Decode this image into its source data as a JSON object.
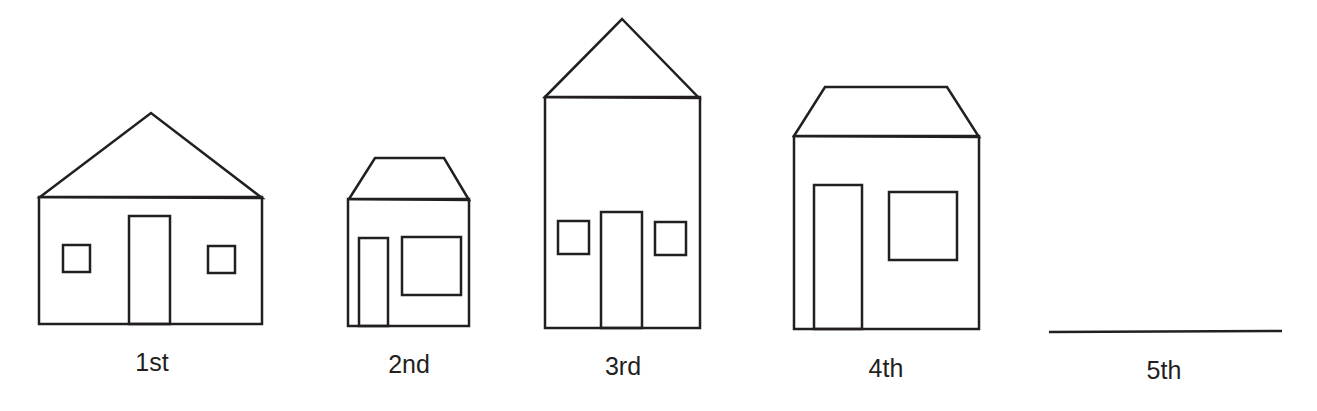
{
  "diagram": {
    "stroke_color": "#231f20",
    "houses": [
      {
        "label": "1st",
        "label_x": 152,
        "label_y": 348
      },
      {
        "label": "2nd",
        "label_x": 409,
        "label_y": 350
      },
      {
        "label": "3rd",
        "label_x": 623,
        "label_y": 352
      },
      {
        "label": "4th",
        "label_x": 886,
        "label_y": 354
      },
      {
        "label": "5th",
        "label_x": 1164,
        "label_y": 356
      }
    ]
  }
}
